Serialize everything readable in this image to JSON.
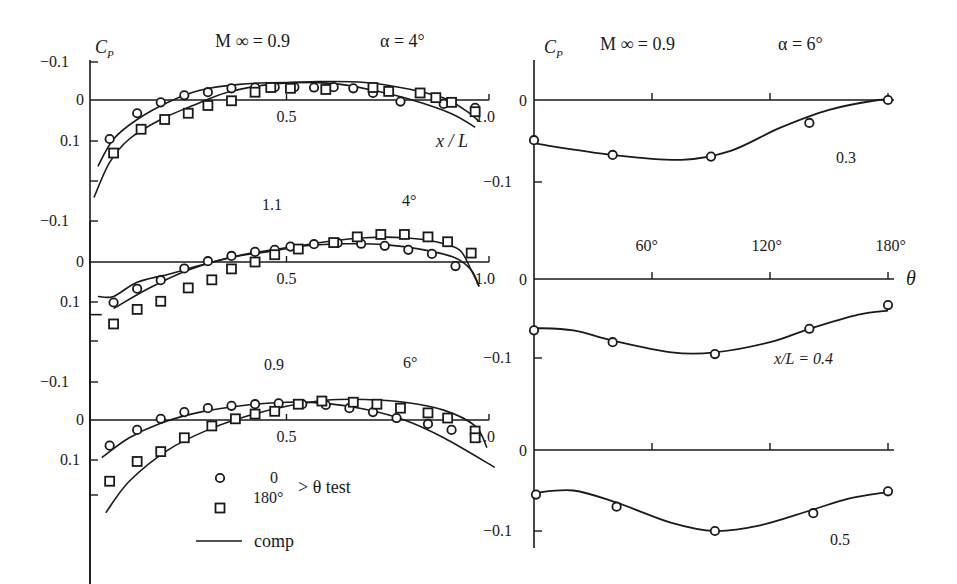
{
  "figure": {
    "left_label_cp": "C",
    "left_label_cp_sub": "P",
    "right_label_cp": "C",
    "right_label_cp_sub": "P",
    "left_mach": "M ∞ = 0.9",
    "left_alpha": "α = 4°",
    "right_mach": "M ∞ = 0.9",
    "right_alpha": "α = 6°",
    "left_xaxis_label": "x / L",
    "right_xaxis_label": "θ",
    "legend": {
      "circle_label": "0",
      "square_label": "180°",
      "brace_label": "> θ  test",
      "line_label": "comp"
    }
  },
  "chart_data": [
    {
      "type": "line",
      "id": "left-1",
      "title": "M∞ = 0.9, α = 4°",
      "mach_label": "",
      "alpha_label": "",
      "xlabel": "x/L",
      "ylabel": "Cp",
      "xlim": [
        0,
        1.0
      ],
      "ylim": [
        0.15,
        -0.1
      ],
      "yticks": [
        "−0.1",
        "0",
        "0.1"
      ],
      "xticks": [
        "0.5",
        "1.0"
      ],
      "series": [
        {
          "name": "test θ=0",
          "marker": "circle",
          "x": [
            0.1,
            0.19,
            0.27,
            0.34,
            0.41,
            0.48,
            0.55,
            0.62,
            0.69,
            0.76,
            0.82,
            0.89,
            0.97
          ],
          "y": [
            0.07,
            0.013,
            -0.003,
            -0.017,
            -0.027,
            -0.04,
            -0.045,
            -0.048,
            -0.048,
            -0.048,
            -0.045,
            -0.04,
            0.016,
            0.005,
            0.027,
            0.035
          ]
        },
        {
          "name": "test θ=180°",
          "marker": "square",
          "x": [
            0.11,
            0.24,
            0.3,
            0.41,
            0.44,
            0.56,
            0.61,
            0.75,
            0.81,
            0.91,
            0.97
          ],
          "y": [
            0.1,
            0.04,
            0.025,
            0.02,
            0.003,
            -0.025,
            -0.05,
            -0.05,
            -0.05,
            -0.045,
            -0.025,
            -0.025,
            0.008,
            0.015
          ]
        },
        {
          "name": "comp θ=0",
          "marker": "none"
        },
        {
          "name": "comp θ=180°",
          "marker": "none"
        }
      ]
    },
    {
      "type": "line",
      "id": "left-2",
      "mach_label": "1.1",
      "alpha_label": "4°",
      "xlabel": "x/L",
      "ylabel": "Cp",
      "xlim": [
        0,
        1.0
      ],
      "yticks": [
        "−0.1",
        "0",
        "0.1"
      ],
      "xticks": [
        "0.5",
        "1.0"
      ]
    },
    {
      "type": "line",
      "id": "left-3",
      "mach_label": "0.9",
      "alpha_label": "6°",
      "xlabel": "x/L",
      "ylabel": "Cp",
      "xlim": [
        0,
        1.0
      ],
      "yticks": [
        "−0.1",
        "0",
        "0.1"
      ],
      "xticks": [
        "0.5",
        "1.0"
      ]
    },
    {
      "type": "line",
      "id": "right-1",
      "title": "M∞ = 0.9, α = 6°",
      "station_label": "0.3",
      "xlabel": "θ",
      "ylabel": "Cp",
      "xlim": [
        0,
        180
      ],
      "ylim": [
        0.0,
        -0.1
      ],
      "yticks": [
        "0",
        "−0.1"
      ],
      "xticks": []
    },
    {
      "type": "line",
      "id": "right-2",
      "station_label": "x/L = 0.4",
      "xlabel": "θ",
      "ylabel": "Cp",
      "xlim": [
        0,
        180
      ],
      "yticks": [
        "0",
        "−0.1"
      ],
      "xticks": [
        "60°",
        "120°",
        "180°"
      ]
    },
    {
      "type": "line",
      "id": "right-3",
      "station_label": "0.5",
      "xlabel": "θ",
      "ylabel": "Cp",
      "xlim": [
        0,
        180
      ],
      "yticks": [
        "0",
        "−0.1"
      ],
      "xticks": []
    }
  ],
  "plots": {
    "left": [
      {
        "id": "left-1",
        "y0": 100,
        "yneg": 62,
        "ypos": 141,
        "extra_tick": 181,
        "axis_top": 62,
        "axis_bottom": 584,
        "mach_label": "",
        "alpha_label": "",
        "circles": [
          [
            0.1,
            0.07
          ],
          [
            0.19,
            0.013
          ],
          [
            0.27,
            -0.003
          ],
          [
            0.34,
            -0.017
          ],
          [
            0.41,
            -0.027
          ],
          [
            0.48,
            -0.04
          ],
          [
            0.55,
            -0.045
          ],
          [
            0.62,
            -0.048
          ],
          [
            0.69,
            -0.048
          ],
          [
            0.76,
            -0.048
          ],
          [
            0.82,
            -0.045
          ],
          [
            0.89,
            -0.04
          ],
          [
            0.97,
            0.016
          ]
        ],
        "circles_extra": [
          [
            0.85,
            -0.035
          ],
          [
            0.91,
            0.016
          ],
          [
            0.95,
            0.027
          ],
          [
            1.0,
            0.035
          ]
        ],
        "squares": [
          [
            0.11,
            0.1
          ],
          [
            0.24,
            0.04
          ],
          [
            0.3,
            0.025
          ],
          [
            0.41,
            0.02
          ],
          [
            0.44,
            0.003
          ],
          [
            0.56,
            -0.025
          ],
          [
            0.61,
            -0.05
          ],
          [
            0.75,
            -0.05
          ],
          [
            0.81,
            -0.05
          ],
          [
            0.91,
            -0.045
          ],
          [
            0.97,
            -0.025
          ],
          [
            1.0,
            -0.025
          ],
          [
            0.99,
            0.008
          ],
          [
            1.03,
            0.015
          ]
        ],
        "comp_circle": [
          [
            0.05,
            0.135
          ],
          [
            0.1,
            0.08
          ],
          [
            0.2,
            0.018
          ],
          [
            0.3,
            -0.015
          ],
          [
            0.4,
            -0.035
          ],
          [
            0.5,
            -0.045
          ],
          [
            0.6,
            -0.048
          ],
          [
            0.7,
            -0.045
          ],
          [
            0.8,
            -0.035
          ],
          [
            0.9,
            -0.003
          ],
          [
            1.0,
            0.03
          ],
          [
            1.05,
            0.05
          ]
        ],
        "comp_square": [
          [
            0.05,
            0.2
          ],
          [
            0.1,
            0.13
          ],
          [
            0.2,
            0.06
          ],
          [
            0.3,
            0.02
          ],
          [
            0.4,
            -0.01
          ],
          [
            0.5,
            -0.03
          ],
          [
            0.6,
            -0.045
          ],
          [
            0.7,
            -0.048
          ],
          [
            0.8,
            -0.045
          ],
          [
            0.9,
            -0.03
          ],
          [
            1.0,
            0.005
          ],
          [
            1.06,
            0.035
          ]
        ]
      },
      {
        "id": "left-2",
        "y0": 262,
        "yneg": 221,
        "ypos": 302,
        "extra_tick": 341,
        "mach_label": "1.1",
        "alpha_label": "4°"
      },
      {
        "id": "left-3",
        "y0": 420,
        "yneg": 381,
        "ypos": 460,
        "extra_tick": 495,
        "mach_label": "0.9",
        "alpha_label": "6°"
      }
    ],
    "right": [
      {
        "id": "right-1",
        "station_label": "0.3"
      },
      {
        "id": "right-2",
        "station_label": "x/L = 0.4"
      },
      {
        "id": "right-3",
        "station_label": "0.5"
      }
    ]
  }
}
